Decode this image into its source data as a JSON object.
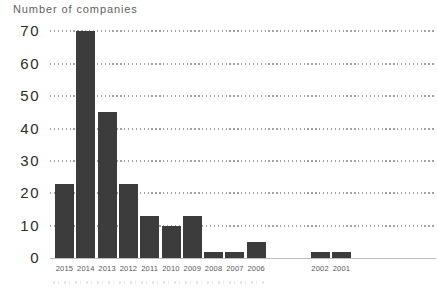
{
  "header": {
    "title": "Number of companies"
  },
  "chart_data": {
    "type": "bar",
    "title": "Number of companies",
    "ylabel": "Number of companies",
    "xlabel": "",
    "categories": [
      "2015",
      "2014",
      "2013",
      "2012",
      "2011",
      "2010",
      "2009",
      "2008",
      "2007",
      "2006",
      "2002",
      "2001"
    ],
    "values": [
      23,
      70,
      45,
      23,
      13,
      10,
      13,
      2,
      2,
      5,
      2,
      2
    ],
    "ylim": [
      0,
      70
    ],
    "yticks": [
      0,
      10,
      20,
      30,
      40,
      50,
      60,
      70
    ],
    "grid": "dotted horizontal",
    "legend": "none",
    "gap_after_category": "2006",
    "gap_slots": 2,
    "colors": {
      "bar": "#3c3c3c",
      "gridline": "#a2a2a2",
      "baseline": "#bdbdbd",
      "ytick_label": "#2d2d2d",
      "xtick_label": "#575757",
      "title": "#5f5f5f",
      "background": "#ffffff"
    }
  }
}
